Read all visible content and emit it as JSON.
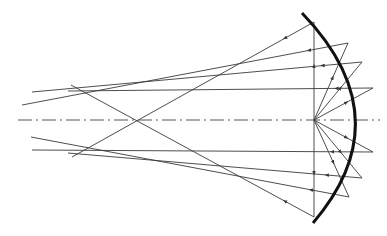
{
  "diagram": {
    "type": "concave-mirror-ray-diagram",
    "colors": {
      "ray": "#3a3a3a",
      "mirror": "#111111",
      "axis": "#555555",
      "background": "#ffffff"
    },
    "mirror": {
      "top": [
        302,
        13
      ],
      "mid": [
        381,
        120
      ],
      "bottom": [
        313,
        223
      ],
      "ctrl": [
        403,
        118
      ]
    },
    "focal_point": [
      314,
      120
    ],
    "axis": {
      "x1": 18,
      "x2": 380,
      "y": 120
    },
    "rays": [
      {
        "name": "ray-top-vertical-to-diag",
        "from": [
          314,
          120
        ],
        "hit": [
          314,
          22
        ],
        "end": [
          72,
          157
        ],
        "arrow_at": [
          0.5,
          0.55
        ]
      },
      {
        "name": "ray-upper-1",
        "from": [
          314,
          120
        ],
        "hit": [
          348,
          43
        ],
        "end": [
          22,
          105
        ]
      },
      {
        "name": "ray-upper-2",
        "from": [
          314,
          120
        ],
        "hit": [
          362,
          62
        ],
        "end": [
          32,
          92
        ]
      },
      {
        "name": "ray-upper-3",
        "from": [
          314,
          120
        ],
        "hit": [
          373,
          88
        ],
        "end": [
          68,
          91
        ]
      },
      {
        "name": "ray-lower-3",
        "from": [
          314,
          120
        ],
        "hit": [
          373,
          152
        ],
        "end": [
          32,
          150
        ]
      },
      {
        "name": "ray-lower-2",
        "from": [
          314,
          120
        ],
        "hit": [
          362,
          178
        ],
        "end": [
          68,
          153
        ]
      },
      {
        "name": "ray-lower-1",
        "from": [
          314,
          120
        ],
        "hit": [
          349,
          197
        ],
        "end": [
          31,
          137
        ]
      },
      {
        "name": "ray-bottom-vertical-to-diag",
        "from": [
          314,
          120
        ],
        "hit": [
          314,
          217
        ],
        "end": [
          71,
          85
        ]
      }
    ]
  }
}
